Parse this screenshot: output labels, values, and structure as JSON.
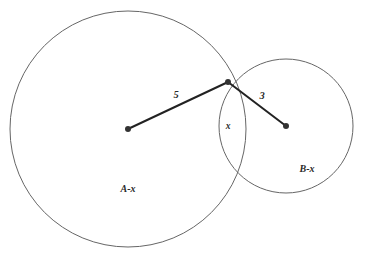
{
  "figure": {
    "type": "venn-two-circle-geometry",
    "background_color": "#ffffff",
    "circle_stroke_color": "#666666",
    "circle_stroke_width": 1,
    "radius_line_color": "#222222",
    "radius_line_width": 2,
    "center_dot_color": "#333333",
    "center_dot_radius": 3,
    "label_color": "#2a2a2a"
  },
  "circles": {
    "left": {
      "name": "A",
      "cx": 128,
      "cy": 129,
      "r": 118
    },
    "right": {
      "name": "B",
      "cx": 286,
      "cy": 126,
      "r": 67
    }
  },
  "intersection": {
    "top": {
      "x": 228,
      "y": 82
    },
    "bottom": {
      "x": 232,
      "y": 173
    }
  },
  "segments": [
    {
      "name": "left-radius",
      "from": {
        "x": 128,
        "y": 129
      },
      "to": {
        "x": 228,
        "y": 82
      },
      "label": "5",
      "label_x": 176,
      "label_y": 96
    },
    {
      "name": "right-radius",
      "from": {
        "x": 286,
        "y": 126
      },
      "to": {
        "x": 228,
        "y": 82
      },
      "label": "3",
      "label_x": 262,
      "label_y": 97
    }
  ],
  "labels": {
    "left_radius": "5",
    "right_radius": "3",
    "lens": "x",
    "left_region": "A-x",
    "right_region": "B-x",
    "lens_x": 228,
    "lens_y": 127,
    "left_region_x": 128,
    "left_region_y": 190,
    "right_region_x": 307,
    "right_region_y": 170
  },
  "chart_data": {
    "type": "diagram",
    "title": "",
    "shapes": [
      {
        "shape": "circle",
        "label": "A",
        "cx": 128,
        "cy": 129,
        "r": 118
      },
      {
        "shape": "circle",
        "label": "B",
        "cx": 286,
        "cy": 126,
        "r": 67
      }
    ],
    "annotations": [
      {
        "text": "5",
        "meaning": "radius of circle A",
        "x": 176,
        "y": 96
      },
      {
        "text": "3",
        "meaning": "radius of circle B",
        "x": 262,
        "y": 97
      },
      {
        "text": "x",
        "meaning": "intersection region",
        "x": 228,
        "y": 127
      },
      {
        "text": "A-x",
        "meaning": "circle A minus intersection",
        "x": 128,
        "y": 190
      },
      {
        "text": "B-x",
        "meaning": "circle B minus intersection",
        "x": 307,
        "y": 170
      }
    ]
  }
}
